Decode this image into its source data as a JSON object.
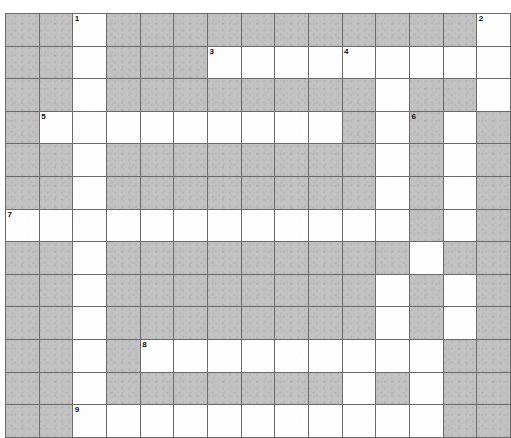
{
  "puzzle": {
    "title": "Crossword Grid",
    "type": "crossword-grid",
    "columns": 15,
    "rows": 13,
    "cell_size_px": 33,
    "colors": {
      "block_fill": "#c2c2c2",
      "open_fill": "#fdfdfd",
      "grid_line": "#6b6b6b",
      "number_text": "#111111",
      "page_background": "#ffffff"
    },
    "legend": {
      "block_char": "#",
      "open_char": "."
    },
    "grid_rows": [
      "##.###########.",
      "##.###.........",
      "##.########.##.",
      "#.........#.#.#",
      "##.########.#.#",
      "##.########.#.#",
      "............#.#",
      "##.#########.##",
      "##.########.#.#",
      "##.########.#.#",
      "##.#.........##",
      "##.#######.#.##",
      "##...........##"
    ],
    "numbered_cells": [
      {
        "number": "1",
        "row": 1,
        "col": 3
      },
      {
        "number": "2",
        "row": 1,
        "col": 15
      },
      {
        "number": "3",
        "row": 2,
        "col": 7
      },
      {
        "number": "4",
        "row": 2,
        "col": 11
      },
      {
        "number": "5",
        "row": 4,
        "col": 2
      },
      {
        "number": "6",
        "row": 4,
        "col": 13
      },
      {
        "number": "7",
        "row": 7,
        "col": 1
      },
      {
        "number": "8",
        "row": 11,
        "col": 5
      },
      {
        "number": "9",
        "row": 13,
        "col": 3
      }
    ],
    "counts": {
      "total_cells": 195,
      "open_cells": 75,
      "block_cells": 120,
      "numbered_entries": 9
    }
  }
}
